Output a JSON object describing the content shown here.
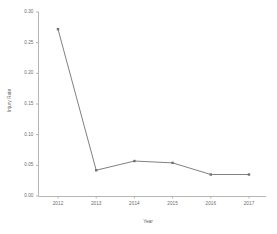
{
  "chart_data": {
    "type": "line",
    "title": "",
    "xlabel": "Year",
    "ylabel": "Injury Rate",
    "categories": [
      "2012",
      "2013",
      "2014",
      "2015",
      "2016",
      "2017"
    ],
    "values": [
      0.272,
      0.042,
      0.057,
      0.054,
      0.035,
      0.035
    ],
    "series": [
      {
        "name": "Injury Rate",
        "values": [
          0.272,
          0.042,
          0.057,
          0.054,
          0.035,
          0.035
        ]
      }
    ],
    "ylim": [
      0.0,
      0.3
    ],
    "xlim": [
      "2012",
      "2017"
    ],
    "yticks": [
      "0.00",
      "0.05",
      "0.10",
      "0.15",
      "0.20",
      "0.25",
      "0.30"
    ],
    "ytick_values": [
      0.0,
      0.05,
      0.1,
      0.15,
      0.2,
      0.25,
      0.3
    ],
    "xticks": [
      "2012",
      "2013",
      "2014",
      "2015",
      "2016",
      "2017"
    ],
    "grid": false,
    "legend": "none",
    "marker": "square",
    "line_color": "#808080",
    "marker_color": "#707070",
    "axis_color": "#b0b0b0",
    "text_color": "#6b6b6b",
    "background": "#ffffff"
  }
}
